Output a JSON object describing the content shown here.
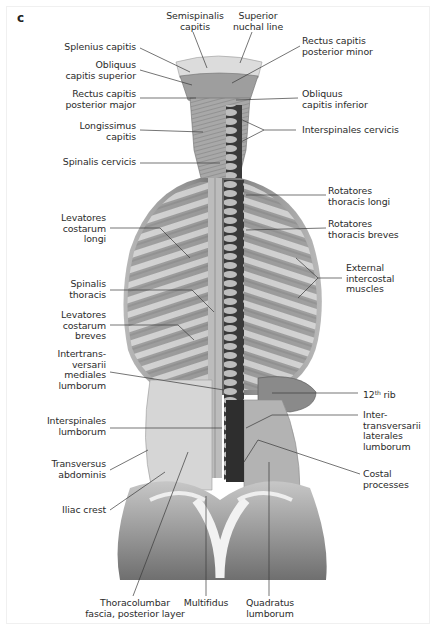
{
  "figure": {
    "panel_letter": "c",
    "labels": {
      "semispinalis_capitis": "Semispinalis\ncapitis",
      "superior_nuchal_line": "Superior\nnuchal line",
      "splenius_capitis": "Splenius capitis",
      "obliquus_capitis_superior": "Obliquus\ncapitis superior",
      "rectus_capitis_posterior_minor": "Rectus capitis\nposterior minor",
      "rectus_capitis_posterior_major": "Rectus capitis\nposterior major",
      "obliquus_capitis_inferior": "Obliquus\ncapitis inferior",
      "longissimus_capitis": "Longissimus\ncapitis",
      "interspinales_cervicis": "Interspinales cervicis",
      "spinalis_cervicis": "Spinalis cervicis",
      "rotatores_thoracis_longi": "Rotatores\nthoracis longi",
      "levatores_costarum_longi": "Levatores\ncostarum\nlongi",
      "rotatores_thoracis_breves": "Rotatores\nthoracis breves",
      "external_intercostal_muscles": "External\nintercostal\nmuscles",
      "spinalis_thoracis": "Spinalis\nthoracis",
      "levatores_costarum_breves": "Levatores\ncostarum\nbreves",
      "intertransversarii_mediales_lumborum": "Intertrans-\nversarii\nmediales\nlumborum",
      "rib_12_number": "12",
      "rib_12_sup": "th",
      "rib_12_word": " rib",
      "intertransversarii_laterales_lumborum": "Inter-\ntransversarii\nlaterales\nlumborum",
      "interspinales_lumborum": "Interspinales\nlumborum",
      "costal_processes": "Costal\nprocesses",
      "transversus_abdominis": "Transversus\nabdominis",
      "iliac_crest": "Iliac crest",
      "thoracolumbar_fascia": "Thoracolumbar\nfascia, posterior layer",
      "multifidus": "Multifidus",
      "quadratus_lumborum": "Quadratus\nlumborum"
    },
    "colors": {
      "text": "#2b2b2b",
      "leader": "#3a3a3a",
      "muscle_light": "#d8d8d8",
      "muscle_mid": "#a9a9a9",
      "muscle_dark": "#5c5c5c",
      "spine_dark": "#2e2e2e"
    }
  }
}
